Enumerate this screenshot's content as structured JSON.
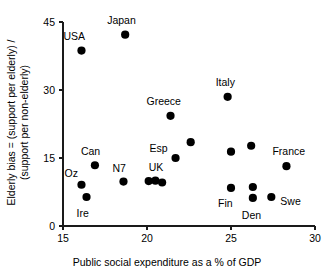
{
  "chart_data": {
    "type": "scatter",
    "title": "",
    "xlabel": "Public social expenditure as a % of GDP",
    "ylabel_line1": "Elderly bias = (support per elderly) /",
    "ylabel_line2": "(support per non-elderly)",
    "xlim": [
      15,
      30
    ],
    "ylim": [
      0,
      45
    ],
    "xticks": [
      "15",
      "20",
      "25",
      "30"
    ],
    "xtick_values": [
      15,
      20,
      25,
      30
    ],
    "yticks": [
      "0",
      "15",
      "30",
      "45"
    ],
    "ytick_values": [
      0,
      15,
      30,
      45
    ],
    "grid": false,
    "legend": "none",
    "points": [
      {
        "label": "USA",
        "x": 16.1,
        "y": 38.7,
        "lx": -18,
        "ly": -15
      },
      {
        "label": "Japan",
        "x": 18.7,
        "y": 42.2,
        "lx": -18,
        "ly": -15
      },
      {
        "label": "Italy",
        "x": 24.8,
        "y": 28.5,
        "lx": -12,
        "ly": -15
      },
      {
        "label": "Greece",
        "x": 21.4,
        "y": 24.3,
        "lx": -24,
        "ly": -15
      },
      {
        "label": "",
        "x": 22.6,
        "y": 18.5,
        "lx": 0,
        "ly": 0
      },
      {
        "label": "",
        "x": 26.2,
        "y": 17.7,
        "lx": 0,
        "ly": 0
      },
      {
        "label": "",
        "x": 25.0,
        "y": 16.4,
        "lx": 0,
        "ly": 0
      },
      {
        "label": "Esp",
        "x": 21.7,
        "y": 15.0,
        "lx": -26,
        "ly": -10
      },
      {
        "label": "Can",
        "x": 16.9,
        "y": 13.4,
        "lx": -14,
        "ly": -14
      },
      {
        "label": "France",
        "x": 28.3,
        "y": 13.2,
        "lx": -14,
        "ly": -15
      },
      {
        "label": "N7",
        "x": 18.6,
        "y": 9.8,
        "lx": -11,
        "ly": -14
      },
      {
        "label": "UK",
        "x": 20.1,
        "y": 9.9,
        "lx": 0,
        "ly": -14
      },
      {
        "label": "",
        "x": 20.5,
        "y": 10.0,
        "lx": 0,
        "ly": 0
      },
      {
        "label": "",
        "x": 20.9,
        "y": 9.6,
        "lx": 0,
        "ly": 0
      },
      {
        "label": "Oz",
        "x": 16.1,
        "y": 9.1,
        "lx": -17,
        "ly": -12
      },
      {
        "label": "",
        "x": 26.3,
        "y": 8.6,
        "lx": 0,
        "ly": 0
      },
      {
        "label": "Fin",
        "x": 25.0,
        "y": 8.4,
        "lx": -13,
        "ly": 15
      },
      {
        "label": "Swe",
        "x": 27.4,
        "y": 6.4,
        "lx": 9,
        "ly": 4
      },
      {
        "label": "Ire",
        "x": 16.4,
        "y": 6.4,
        "lx": -10,
        "ly": 16
      },
      {
        "label": "Den",
        "x": 26.3,
        "y": 6.2,
        "lx": -11,
        "ly": 17
      }
    ]
  },
  "axes_geometry": {
    "plot_left": 63,
    "plot_right": 315,
    "plot_top": 22,
    "plot_bottom": 226
  }
}
